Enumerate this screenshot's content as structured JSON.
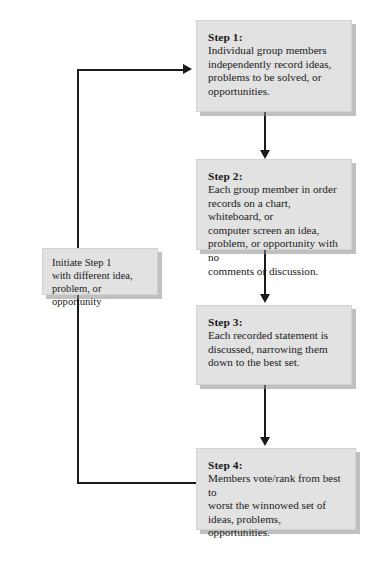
{
  "diagram": {
    "boxes": {
      "step1": {
        "heading": "Step 1:",
        "body": "Individual group members\nindependently record ideas,\nproblems to be solved, or\nopportunities."
      },
      "step2": {
        "heading": "Step 2:",
        "body": "Each group member in order\nrecords on a chart, whiteboard, or\ncomputer screen an idea,\nproblem, or opportunity with no\ncomments or discussion."
      },
      "step3": {
        "heading": "Step 3:",
        "body": "Each recorded statement is\ndiscussed, narrowing them\ndown to the best set."
      },
      "step4": {
        "heading": "Step 4:",
        "body": "Members vote/rank from best to\nworst the winnowed set of\nideas, problems, opportunities."
      },
      "initiate": {
        "heading": "",
        "body": "Initiate Step 1\nwith different idea,\nproblem, or opportunity"
      }
    },
    "connectors": [
      {
        "name": "step1-to-step2",
        "from": "step1",
        "to": "step2",
        "direction": "down"
      },
      {
        "name": "step2-to-step3",
        "from": "step2",
        "to": "step3",
        "direction": "down"
      },
      {
        "name": "step3-to-step4",
        "from": "step3",
        "to": "step4",
        "direction": "down"
      },
      {
        "name": "feedback-loop",
        "from": "step4",
        "to": "step1",
        "direction": "left-up-right"
      }
    ],
    "colors": {
      "box_fill": "#e2e2e2",
      "box_border": "#d2d2d2",
      "shadow": "#8c8c8c",
      "line": "#1a1a1a",
      "text": "#1a1a1a",
      "background": "#ffffff"
    }
  }
}
